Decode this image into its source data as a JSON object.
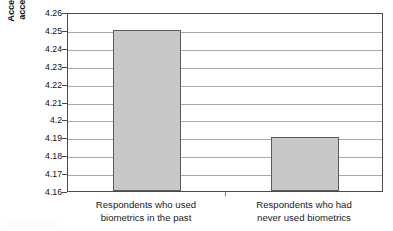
{
  "chart_data": {
    "type": "bar",
    "title": "",
    "xlabel": "",
    "ylabel": "Acceptability rating (1=not at all acceptable, 5=very acceptable)",
    "categories": [
      "Respondents who used biometrics in the past",
      "Respondents who had never used biometrics"
    ],
    "values": [
      4.25,
      4.19
    ],
    "ylim": [
      4.16,
      4.26
    ],
    "ytick_step": 0.01,
    "yticks": [
      4.26,
      4.25,
      4.24,
      4.23,
      4.22,
      4.21,
      4.2,
      4.19,
      4.18,
      4.17,
      4.16
    ],
    "ytick_labels": [
      "4.26",
      "4.25",
      "4.24",
      "4.23",
      "4.22",
      "4.21",
      "4.2",
      "4.19",
      "4.18",
      "4.17",
      "4.16"
    ],
    "grid": true,
    "legend": false,
    "legend_position": "none",
    "colors": {
      "bar_fill": "#c8c8c8",
      "bar_border": "#5a5a5a",
      "gridline": "#a9a9a9",
      "axis": "#4a4a4a",
      "text": "#1a1a1a",
      "background": "#ffffff"
    }
  },
  "axis": {
    "y_title_lines": [
      "Acceptability rating (1=not at all",
      "acceptable, 5=very acceptable)"
    ],
    "x_category_lines": [
      [
        "Respondents who used",
        "biometrics in the past"
      ],
      [
        "Respondents who had",
        "never used biometrics"
      ]
    ]
  }
}
